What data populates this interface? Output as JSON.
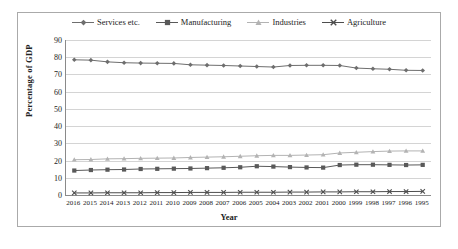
{
  "chart_data": {
    "type": "line",
    "title": "",
    "xlabel": "Year",
    "ylabel": "Percentage of GDP",
    "ylim": [
      0,
      90
    ],
    "yticks": [
      0,
      10,
      20,
      30,
      40,
      50,
      60,
      70,
      80,
      90
    ],
    "grid": true,
    "legend_position": "top-center",
    "categories": [
      "2016",
      "2015",
      "2014",
      "2013",
      "2012",
      "2011",
      "2010",
      "2009",
      "2008",
      "2007",
      "2006",
      "2005",
      "2004",
      "2003",
      "2002",
      "2001",
      "2000",
      "1999",
      "1998",
      "1997",
      "1996",
      "1995"
    ],
    "series": [
      {
        "name": "Services etc.",
        "color": "#6e6e6e",
        "marker": "diamond",
        "values": [
          78.5,
          78.3,
          77.3,
          76.8,
          76.6,
          76.5,
          76.4,
          75.6,
          75.4,
          75.2,
          74.9,
          74.6,
          74.3,
          75.2,
          75.3,
          75.3,
          75.2,
          73.7,
          73.3,
          73.0,
          72.4,
          72.3
        ]
      },
      {
        "name": "Manufacturing",
        "color": "#595959",
        "marker": "square",
        "values": [
          14.2,
          14.5,
          14.7,
          14.8,
          15.1,
          15.2,
          15.3,
          15.4,
          15.6,
          15.8,
          16.1,
          16.7,
          16.5,
          16.2,
          16.0,
          15.9,
          17.4,
          17.6,
          17.6,
          17.5,
          17.4,
          17.5
        ]
      },
      {
        "name": "Industries",
        "color": "#b3b3b3",
        "marker": "triangle",
        "values": [
          20.5,
          20.6,
          21.0,
          21.1,
          21.3,
          21.4,
          21.5,
          21.8,
          22.0,
          22.2,
          22.5,
          22.8,
          23.0,
          23.0,
          23.2,
          23.4,
          24.4,
          24.8,
          25.2,
          25.5,
          25.6,
          25.6
        ]
      },
      {
        "name": "Agriculture",
        "color": "#4d4d4d",
        "marker": "x",
        "values": [
          1.2,
          1.2,
          1.3,
          1.3,
          1.3,
          1.4,
          1.4,
          1.5,
          1.5,
          1.5,
          1.6,
          1.6,
          1.6,
          1.7,
          1.7,
          1.8,
          1.8,
          1.9,
          1.9,
          2.0,
          2.0,
          2.1
        ]
      }
    ]
  }
}
